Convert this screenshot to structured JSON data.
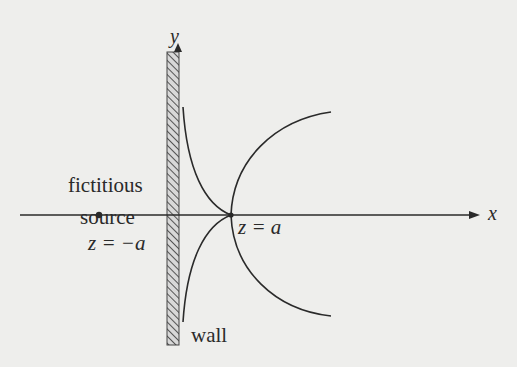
{
  "diagram": {
    "labels": {
      "y_axis": "y",
      "x_axis": "x",
      "fictitious": "fictitious",
      "source": "source",
      "source_position": "z = −a",
      "real_position": "z = a",
      "wall": "wall"
    },
    "colors": {
      "background": "#eeeeec",
      "ink": "#2a2a2a",
      "wall_fill": "#8a8a8a"
    }
  }
}
